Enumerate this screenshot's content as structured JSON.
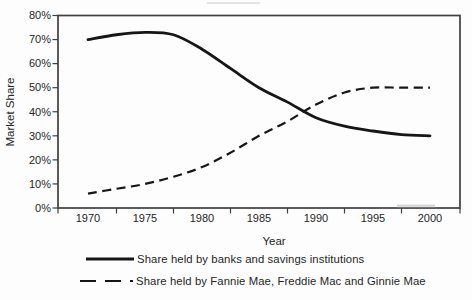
{
  "figure": {
    "background": "#fdfdfd",
    "line_color": "#161616",
    "frame_color": "#3f3f3f"
  },
  "chart_data": {
    "type": "line",
    "title": "",
    "xlabel": "Year",
    "ylabel": "Market Share",
    "x_tick_labels": [
      "1970",
      "1975",
      "1980",
      "1985",
      "1990",
      "1995",
      "2000"
    ],
    "x_ticks": [
      1970,
      1975,
      1980,
      1985,
      1990,
      1995,
      2000
    ],
    "y_tick_labels": [
      "0%",
      "10%",
      "20%",
      "30%",
      "40%",
      "50%",
      "60%",
      "70%",
      "80%"
    ],
    "y_ticks": [
      0,
      10,
      20,
      30,
      40,
      50,
      60,
      70,
      80
    ],
    "xlim": [
      1970,
      2000
    ],
    "ylim": [
      0,
      80
    ],
    "grid": false,
    "legend_position": "bottom",
    "series": [
      {
        "name": "Share held by banks and savings institutions",
        "style": "solid",
        "x": [
          1970,
          1972.5,
          1975,
          1977.5,
          1980,
          1982.5,
          1985,
          1987.5,
          1990,
          1992.5,
          1995,
          1997.5,
          2000
        ],
        "values": [
          70,
          72,
          73,
          72,
          66,
          58,
          50,
          44,
          37.5,
          34,
          32,
          30.5,
          30
        ]
      },
      {
        "name": "Share held by Fannie Mae, Freddie Mac and Ginnie Mae",
        "style": "dashed",
        "x": [
          1970,
          1972.5,
          1975,
          1977.5,
          1980,
          1982.5,
          1985,
          1987.5,
          1990,
          1992.5,
          1995,
          1997.5,
          2000
        ],
        "values": [
          6,
          8,
          10,
          13,
          17,
          23,
          30,
          36,
          43,
          48,
          50,
          50,
          50
        ]
      }
    ]
  }
}
